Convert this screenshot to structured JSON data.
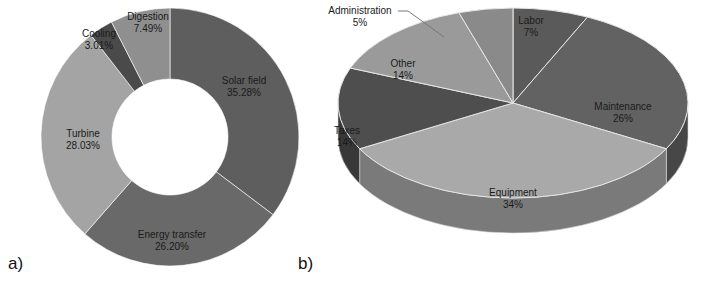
{
  "chart_data": [
    {
      "type": "pie",
      "variant": "donut",
      "panel_label": "a)",
      "title": "",
      "categories": [
        "Solar field",
        "Energy transfer",
        "Turbine",
        "Cooling",
        "Digestion"
      ],
      "values": [
        35.28,
        26.2,
        28.03,
        3.01,
        7.49
      ],
      "labels": [
        "35.28%",
        "26.20%",
        "28.03%",
        "3.01%",
        "7.49%"
      ],
      "colors": [
        "#5e5e5e",
        "#696969",
        "#a4a4a4",
        "#4a4a4a",
        "#8f8f8f"
      ],
      "legend": "none",
      "data_labels": "category and percentage inside slices"
    },
    {
      "type": "pie",
      "variant": "3d",
      "panel_label": "b)",
      "title": "",
      "categories": [
        "Labor",
        "Maintenance",
        "Equipment",
        "Taxes",
        "Other",
        "Administration"
      ],
      "values": [
        7,
        26,
        34,
        14,
        14,
        5
      ],
      "labels": [
        "7%",
        "26%",
        "34%",
        "14%",
        "14%",
        "5%"
      ],
      "colors": [
        "#5a5a5a",
        "#626262",
        "#a9a9a9",
        "#4e4e4e",
        "#9a9a9a",
        "#8a8a8a"
      ],
      "legend": "none",
      "data_labels": "category and percentage; Administration labeled outside with leader line"
    }
  ],
  "panels": {
    "a": {
      "label": "a)"
    },
    "b": {
      "label": "b)"
    }
  }
}
